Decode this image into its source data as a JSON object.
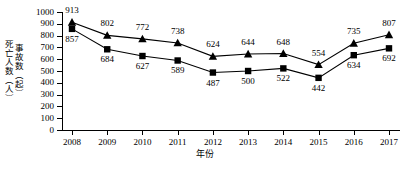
{
  "chart_data": {
    "type": "line",
    "title": "",
    "xlabel": "年份",
    "ylabel_lines": [
      "死亡人数（人）",
      "事故数（起）"
    ],
    "categories": [
      "2008",
      "2009",
      "2010",
      "2011",
      "2012",
      "2013",
      "2014",
      "2015",
      "2016",
      "2017"
    ],
    "ylim": [
      0,
      1000
    ],
    "ytick_values": [
      "1000",
      "900",
      "800",
      "700",
      "600",
      "500",
      "400",
      "300",
      "200",
      "100",
      "0"
    ],
    "grid": false,
    "legend": "none",
    "series": [
      {
        "name": "死亡人数（人）",
        "marker": "triangle",
        "values": [
          913,
          802,
          772,
          738,
          624,
          644,
          648,
          554,
          735,
          807
        ],
        "labels": [
          "913",
          "802",
          "772",
          "738",
          "624",
          "644",
          "648",
          "554",
          "735",
          "807"
        ],
        "label_positions": [
          "above",
          "above",
          "above",
          "above",
          "above",
          "above",
          "above",
          "above",
          "above",
          "above"
        ]
      },
      {
        "name": "事故数（起）",
        "marker": "square",
        "values": [
          857,
          684,
          627,
          589,
          487,
          500,
          522,
          442,
          634,
          692
        ],
        "labels": [
          "857",
          "684",
          "627",
          "589",
          "487",
          "500",
          "522",
          "442",
          "634",
          "692"
        ],
        "label_positions": [
          "below",
          "below",
          "below",
          "below",
          "below",
          "below",
          "below",
          "below",
          "below",
          "below"
        ]
      }
    ],
    "colors": {
      "axis": "#000000",
      "series1": "#000000",
      "series2": "#000000",
      "background": "#ffffff"
    }
  }
}
